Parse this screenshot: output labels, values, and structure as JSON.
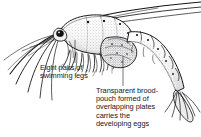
{
  "figure": {
    "background_color": "#ffffff",
    "ink_color": "#17171a",
    "style": "black-and-white stipple line engraving"
  },
  "annotations": [
    {
      "id": "swimming-legs",
      "text": "Eight pairs of\nswimming legs",
      "lines": [
        "Eight pairs of",
        "swimming legs"
      ],
      "leader": {
        "x": 75,
        "y_top": 40,
        "y_bottom": 63
      }
    },
    {
      "id": "brood-pouch",
      "text": "Transparent brood-\npouch formed of\noverlapping plates\ncarries the\ndeveloping eggs",
      "lines": [
        "Transparent brood-",
        "pouch formed of",
        "overlapping plates",
        "carries the",
        "developing eggs"
      ],
      "leader": {
        "x": 123,
        "y_top": 56,
        "y_bottom": 86
      }
    }
  ],
  "anatomy": {
    "parts": [
      "antennae",
      "eye",
      "carapace",
      "swimming legs",
      "brood pouch",
      "abdomen segments",
      "tail fan"
    ],
    "abdomen_segment_count": 6,
    "swimming_leg_pairs": 8
  }
}
